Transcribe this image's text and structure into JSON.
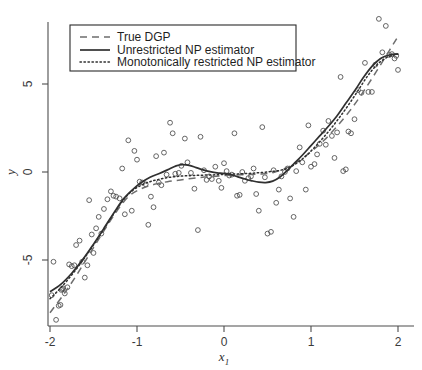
{
  "chart_data": {
    "type": "scatter",
    "title": "",
    "xlabel": "x_1",
    "ylabel": "y",
    "xlim": [
      -2.1,
      2.15
    ],
    "ylim": [
      -9.0,
      9.2
    ],
    "grid": false,
    "xticks": [
      -2,
      -1,
      0,
      1,
      2
    ],
    "xticklabels": [
      "-2",
      "-1",
      "0",
      "1",
      "2"
    ],
    "yticks": [
      5,
      0,
      -5
    ],
    "yticklabels": [
      "5",
      "0",
      "-5"
    ],
    "legend_position": "upper-left",
    "legend": [
      {
        "label": "True DGP",
        "style": "dashed",
        "color": "#6e6e6e"
      },
      {
        "label": "Unrestricted NP estimator",
        "style": "solid",
        "color": "#303030"
      },
      {
        "label": "Monotonically restricted NP estimator",
        "style": "dotted",
        "color": "#303030"
      }
    ],
    "marker": {
      "shape": "open-circle",
      "radius": 2.4,
      "color": "#4a4a4a"
    },
    "scatter": {
      "x": [
        -1.98,
        -1.96,
        -1.93,
        -1.9,
        -1.88,
        -1.87,
        -1.86,
        -1.85,
        -1.83,
        -1.8,
        -1.78,
        -1.75,
        -1.72,
        -1.7,
        -1.66,
        -1.63,
        -1.6,
        -1.57,
        -1.55,
        -1.52,
        -1.5,
        -1.47,
        -1.44,
        -1.41,
        -1.38,
        -1.34,
        -1.3,
        -1.27,
        -1.24,
        -1.2,
        -1.17,
        -1.14,
        -1.1,
        -1.06,
        -1.03,
        -1.0,
        -0.97,
        -0.94,
        -0.9,
        -0.87,
        -0.84,
        -0.81,
        -0.78,
        -0.75,
        -0.72,
        -0.69,
        -0.66,
        -0.62,
        -0.59,
        -0.56,
        -0.52,
        -0.49,
        -0.45,
        -0.42,
        -0.38,
        -0.34,
        -0.3,
        -0.27,
        -0.23,
        -0.2,
        -0.17,
        -0.14,
        -0.1,
        -0.06,
        -0.03,
        0.0,
        0.03,
        0.06,
        0.09,
        0.12,
        0.15,
        0.18,
        0.21,
        0.24,
        0.28,
        0.31,
        0.34,
        0.37,
        0.4,
        0.44,
        0.47,
        0.5,
        0.54,
        0.57,
        0.6,
        0.63,
        0.66,
        0.7,
        0.73,
        0.76,
        0.8,
        0.83,
        0.87,
        0.9,
        0.94,
        0.97,
        1.0,
        1.04,
        1.07,
        1.1,
        1.14,
        1.17,
        1.2,
        1.24,
        1.27,
        1.3,
        1.34,
        1.37,
        1.4,
        1.43,
        1.46,
        1.5,
        1.54,
        1.58,
        1.62,
        1.66,
        1.7,
        1.74,
        1.78,
        1.82,
        1.86,
        1.9,
        1.93,
        1.96,
        1.98,
        2.0
      ],
      "y": [
        -7.0,
        -5.1,
        -8.4,
        -7.6,
        -7.55,
        -6.7,
        -6.65,
        -6.6,
        -6.9,
        -6.55,
        -5.25,
        -5.35,
        -5.3,
        -4.15,
        -3.9,
        -5.1,
        -6.0,
        -5.3,
        -1.6,
        -3.55,
        -4.6,
        -3.2,
        -2.55,
        -3.5,
        -2.1,
        -1.55,
        -1.1,
        -1.35,
        -1.4,
        -1.5,
        0.2,
        -2.4,
        1.8,
        -2.2,
        1.2,
        0.7,
        -0.55,
        -0.6,
        -0.7,
        -3.0,
        -1.4,
        -2.0,
        0.9,
        -0.6,
        -0.75,
        1.1,
        -0.15,
        2.8,
        2.2,
        -0.1,
        -0.05,
        0.35,
        1.9,
        0.55,
        -0.05,
        -0.95,
        -3.3,
        2.0,
        0.1,
        -0.45,
        -0.25,
        -0.4,
        0.3,
        -0.5,
        -0.9,
        0.5,
        0.05,
        -0.2,
        -0.15,
        2.2,
        -1.35,
        -1.3,
        0.0,
        -0.5,
        -0.35,
        -0.25,
        0.2,
        -1.25,
        -2.2,
        2.55,
        -0.3,
        -3.5,
        -3.4,
        0.1,
        -1.75,
        -1.0,
        -0.25,
        0.0,
        0.2,
        -1.5,
        -2.55,
        0.05,
        1.4,
        0.55,
        -1.0,
        2.65,
        0.3,
        0.45,
        1.0,
        1.6,
        2.35,
        1.55,
        2.9,
        2.05,
        0.8,
        2.25,
        5.4,
        0.05,
        0.15,
        2.3,
        2.2,
        3.0,
        4.65,
        4.5,
        6.2,
        4.55,
        4.55,
        6.1,
        8.7,
        6.8,
        8.3,
        6.65,
        6.7,
        6.45,
        6.6,
        5.8
      ]
    },
    "series": [
      {
        "name": "True DGP",
        "style": "dashed",
        "x": [
          -2.0,
          -1.85,
          -1.7,
          -1.55,
          -1.4,
          -1.25,
          -1.1,
          -0.95,
          -0.8,
          -0.65,
          -0.5,
          -0.35,
          -0.2,
          -0.05,
          0.1,
          0.25,
          0.4,
          0.55,
          0.7,
          0.85,
          1.0,
          1.15,
          1.3,
          1.45,
          1.6,
          1.75,
          1.9,
          2.0
        ],
        "y": [
          -8.0,
          -7.0,
          -5.9,
          -4.7,
          -3.5,
          -2.35,
          -1.4,
          -0.95,
          -0.7,
          -0.55,
          -0.45,
          -0.35,
          -0.28,
          -0.22,
          -0.18,
          -0.15,
          -0.12,
          -0.05,
          0.2,
          0.6,
          1.15,
          1.8,
          2.6,
          3.5,
          4.55,
          5.7,
          6.9,
          7.7
        ]
      },
      {
        "name": "Unrestricted NP estimator",
        "style": "solid",
        "x": [
          -2.0,
          -1.88,
          -1.75,
          -1.62,
          -1.5,
          -1.38,
          -1.25,
          -1.15,
          -1.05,
          -0.95,
          -0.85,
          -0.75,
          -0.65,
          -0.55,
          -0.48,
          -0.4,
          -0.32,
          -0.24,
          -0.16,
          -0.08,
          0.0,
          0.08,
          0.16,
          0.24,
          0.32,
          0.4,
          0.48,
          0.56,
          0.64,
          0.72,
          0.8,
          0.9,
          1.0,
          1.1,
          1.2,
          1.3,
          1.4,
          1.5,
          1.6,
          1.7,
          1.8,
          1.9,
          2.0
        ],
        "y": [
          -6.8,
          -6.4,
          -5.75,
          -4.95,
          -4.1,
          -3.2,
          -2.2,
          -1.5,
          -1.0,
          -0.6,
          -0.3,
          -0.1,
          0.12,
          0.35,
          0.42,
          0.38,
          0.25,
          0.12,
          0.02,
          -0.05,
          -0.08,
          -0.15,
          -0.28,
          -0.4,
          -0.5,
          -0.58,
          -0.6,
          -0.52,
          -0.3,
          0.05,
          0.45,
          0.95,
          1.5,
          2.05,
          2.6,
          3.2,
          3.9,
          4.6,
          5.35,
          6.0,
          6.45,
          6.65,
          6.7
        ]
      },
      {
        "name": "Monotonically restricted NP estimator",
        "style": "dotted",
        "x": [
          -2.0,
          -1.88,
          -1.75,
          -1.62,
          -1.5,
          -1.38,
          -1.25,
          -1.15,
          -1.05,
          -0.95,
          -0.85,
          -0.75,
          -0.65,
          -0.55,
          -0.45,
          -0.35,
          -0.25,
          -0.15,
          -0.05,
          0.05,
          0.15,
          0.25,
          0.35,
          0.45,
          0.55,
          0.65,
          0.75,
          0.85,
          0.95,
          1.05,
          1.15,
          1.25,
          1.35,
          1.45,
          1.55,
          1.65,
          1.75,
          1.85,
          1.95,
          2.0
        ],
        "y": [
          -7.2,
          -6.6,
          -5.85,
          -5.0,
          -4.15,
          -3.25,
          -2.25,
          -1.55,
          -1.05,
          -0.75,
          -0.55,
          -0.42,
          -0.32,
          -0.26,
          -0.22,
          -0.2,
          -0.18,
          -0.17,
          -0.15,
          -0.13,
          -0.11,
          -0.09,
          -0.06,
          -0.02,
          0.03,
          0.1,
          0.25,
          0.55,
          0.95,
          1.45,
          2.0,
          2.6,
          3.25,
          3.95,
          4.7,
          5.45,
          6.05,
          6.45,
          6.65,
          6.7
        ]
      }
    ]
  }
}
